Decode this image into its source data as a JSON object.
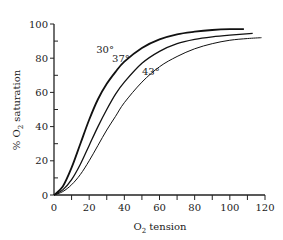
{
  "chart_data": {
    "type": "line",
    "title": "",
    "xlabel": "O2 tension",
    "ylabel": "% O2 saturation",
    "xlim": [
      0,
      120
    ],
    "ylim": [
      0,
      100
    ],
    "x_ticks": [
      0,
      20,
      40,
      60,
      80,
      100,
      120
    ],
    "x_minor_step": 10,
    "y_ticks": [
      0,
      20,
      40,
      60,
      80,
      100
    ],
    "y_minor_step": 10,
    "grid": false,
    "legend": "inline labels on curves",
    "series": [
      {
        "name": "30°",
        "label": "30°",
        "stroke_width": 1.8,
        "x": [
          0,
          5,
          10,
          15,
          20,
          25,
          30,
          35,
          40,
          50,
          60,
          70,
          80,
          90,
          100,
          108
        ],
        "y": [
          0,
          5,
          16,
          30,
          44,
          56,
          65,
          72,
          78,
          86,
          91,
          94,
          95.5,
          96.5,
          97,
          97
        ]
      },
      {
        "name": "37°",
        "label": "37°",
        "stroke_width": 1.3,
        "x": [
          0,
          5,
          10,
          15,
          20,
          25,
          30,
          35,
          40,
          50,
          60,
          70,
          80,
          90,
          100,
          113
        ],
        "y": [
          0,
          3,
          9,
          18,
          29,
          40,
          50,
          59,
          66,
          77,
          84,
          88.5,
          91,
          92.5,
          93.5,
          94.5
        ]
      },
      {
        "name": "43°",
        "label": "43°",
        "stroke_width": 1.0,
        "x": [
          0,
          5,
          10,
          15,
          20,
          25,
          30,
          35,
          40,
          50,
          60,
          70,
          80,
          90,
          100,
          110,
          118
        ],
        "y": [
          0,
          2,
          6,
          12,
          20,
          29,
          38,
          46,
          54,
          66,
          75,
          81,
          85.5,
          88.5,
          90.5,
          91.5,
          92
        ]
      }
    ],
    "annotations": [
      {
        "text": "30°",
        "x": 24,
        "y": 83
      },
      {
        "text": "37°",
        "x": 33,
        "y": 78
      },
      {
        "text": "43°",
        "x": 50,
        "y": 70
      }
    ]
  },
  "labels": {
    "ylabel_prefix": "% O",
    "ylabel_sub": "2",
    "ylabel_suffix": " saturation",
    "xlabel_prefix": "O",
    "xlabel_sub": "2",
    "xlabel_suffix": " tension"
  }
}
